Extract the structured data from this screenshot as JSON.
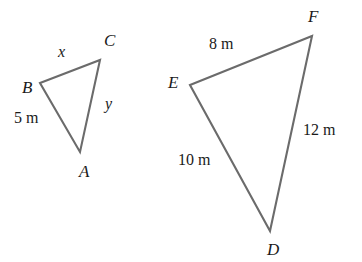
{
  "figure": {
    "background_color": "#ffffff",
    "stroke_color": "#6b6b6b",
    "text_color": "#1a1a1a",
    "width": 362,
    "height": 262
  },
  "small_triangle": {
    "name": "triangle-abc",
    "vertices": [
      {
        "label": "B",
        "x": 40,
        "y": 83,
        "label_x": 22,
        "label_y": 79
      },
      {
        "label": "C",
        "x": 100,
        "y": 60,
        "label_x": 104,
        "label_y": 32
      },
      {
        "label": "A",
        "x": 80,
        "y": 152,
        "label_x": 79,
        "label_y": 163
      }
    ],
    "sides": [
      {
        "label": "x",
        "from": "B",
        "to": "C",
        "label_x": 58,
        "label_y": 44,
        "kind": "variable"
      },
      {
        "label": "y",
        "from": "C",
        "to": "A",
        "label_x": 105,
        "label_y": 96,
        "kind": "variable"
      },
      {
        "label": "5 m",
        "from": "A",
        "to": "B",
        "label_x": 14,
        "label_y": 110,
        "kind": "measure"
      }
    ]
  },
  "large_triangle": {
    "name": "triangle-def",
    "vertices": [
      {
        "label": "E",
        "x": 190,
        "y": 85,
        "label_x": 168,
        "label_y": 74
      },
      {
        "label": "F",
        "x": 312,
        "y": 36,
        "label_x": 308,
        "label_y": 8
      },
      {
        "label": "D",
        "x": 270,
        "y": 231,
        "label_x": 267,
        "label_y": 241
      }
    ],
    "sides": [
      {
        "label": "8 m",
        "from": "E",
        "to": "F",
        "label_x": 209,
        "label_y": 36,
        "kind": "measure"
      },
      {
        "label": "12 m",
        "from": "F",
        "to": "D",
        "label_x": 303,
        "label_y": 122,
        "kind": "measure"
      },
      {
        "label": "10 m",
        "from": "D",
        "to": "E",
        "label_x": 178,
        "label_y": 152,
        "kind": "measure"
      }
    ]
  }
}
